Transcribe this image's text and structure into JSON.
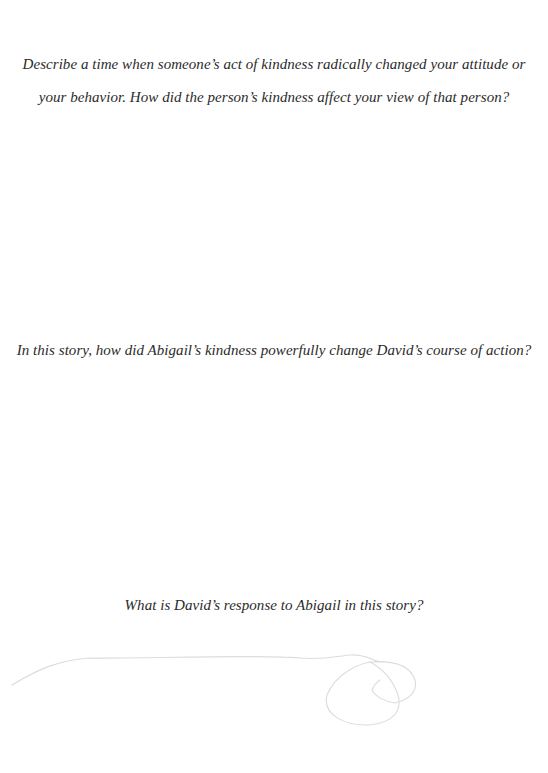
{
  "prompts": [
    {
      "line1": "Describe a time when someone’s act of kindness radically changed your attitude or",
      "line2": "your behavior. How did the person’s kindness affect your view of that person?"
    },
    {
      "text": "In this story, how did Abigail’s kindness powerfully change David’s course of action?"
    },
    {
      "text": "What is David’s response to Abigail in this story?"
    }
  ],
  "decoration": {
    "icon": "swirl-flourish-icon",
    "color": "#dcdcdc"
  }
}
